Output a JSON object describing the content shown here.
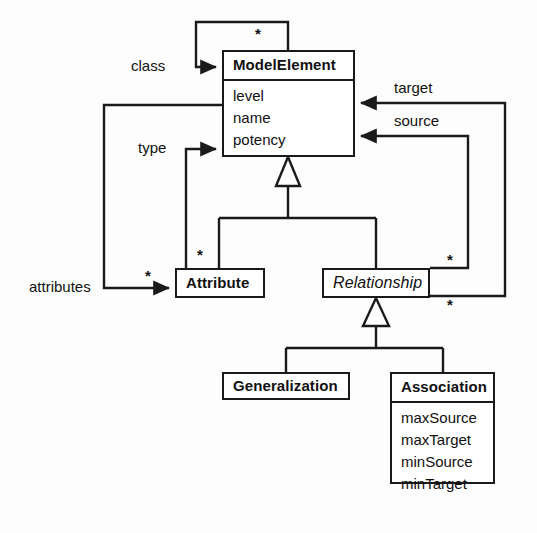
{
  "diagram": {
    "type": "uml-class-diagram",
    "stroke_color": "#1a1a1a",
    "fill_color": "#ffffff",
    "background_color": "#fdfdfd"
  },
  "classes": {
    "model_element": {
      "name": "ModelElement",
      "abstract": false,
      "attributes": [
        "level",
        "name",
        "potency"
      ]
    },
    "attribute": {
      "name": "Attribute",
      "abstract": false,
      "attributes": []
    },
    "relationship": {
      "name": "Relationship",
      "abstract": true,
      "attributes": []
    },
    "generalization": {
      "name": "Generalization",
      "abstract": false,
      "attributes": []
    },
    "association": {
      "name": "Association",
      "abstract": false,
      "attributes": [
        "maxSource",
        "maxTarget",
        "minSource",
        "minTarget"
      ]
    }
  },
  "associations": {
    "class_role": "class",
    "type_role": "type",
    "attributes_role": "attributes",
    "target_role": "target",
    "source_role": "source"
  },
  "multiplicities": {
    "class_star": "*",
    "attributes_star_left": "*",
    "attributes_star_right": "*",
    "source_star": "*",
    "target_star": "*"
  }
}
